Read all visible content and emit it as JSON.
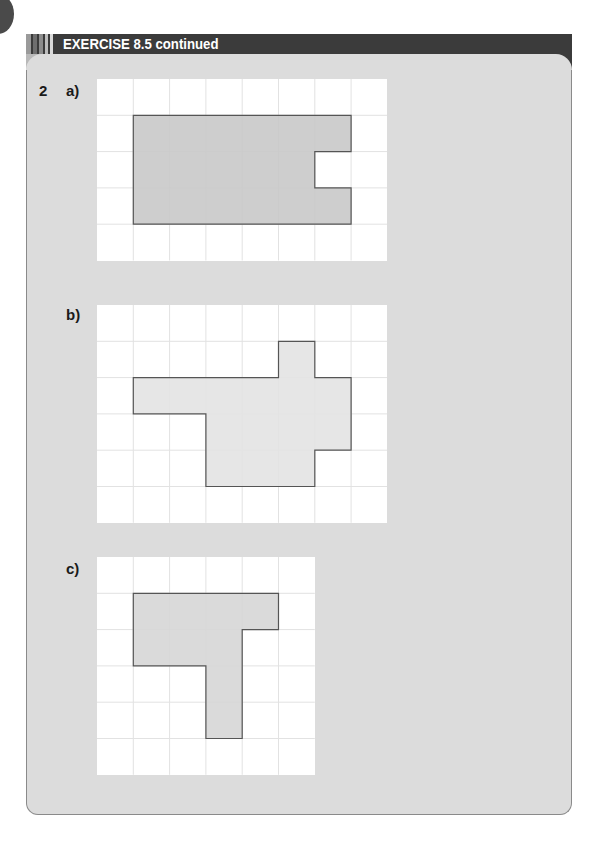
{
  "header": {
    "title": "EXERCISE 8.5 continued"
  },
  "question": {
    "number": "2",
    "parts": [
      {
        "label": "a)",
        "grid": {
          "cols": 8,
          "rows": 5,
          "cell": 36.3
        },
        "shape_fill": "#c9c9c9",
        "shape": [
          [
            1,
            1
          ],
          [
            7,
            1
          ],
          [
            7,
            2
          ],
          [
            6,
            2
          ],
          [
            6,
            3
          ],
          [
            7,
            3
          ],
          [
            7,
            4
          ],
          [
            1,
            4
          ]
        ]
      },
      {
        "label": "b)",
        "grid": {
          "cols": 8,
          "rows": 6,
          "cell": 36.3
        },
        "shape_fill": "#e3e3e3",
        "shape": [
          [
            5,
            1
          ],
          [
            6,
            1
          ],
          [
            6,
            2
          ],
          [
            7,
            2
          ],
          [
            7,
            4
          ],
          [
            6,
            4
          ],
          [
            6,
            5
          ],
          [
            3,
            5
          ],
          [
            3,
            3
          ],
          [
            1,
            3
          ],
          [
            1,
            2
          ],
          [
            5,
            2
          ]
        ]
      },
      {
        "label": "c)",
        "grid": {
          "cols": 6,
          "rows": 6,
          "cell": 36.3
        },
        "shape_fill": "#d6d6d6",
        "shape": [
          [
            1,
            1
          ],
          [
            5,
            1
          ],
          [
            5,
            2
          ],
          [
            4,
            2
          ],
          [
            4,
            5
          ],
          [
            3,
            5
          ],
          [
            3,
            3
          ],
          [
            1,
            3
          ]
        ]
      }
    ]
  },
  "colors": {
    "header_bg": "#3b3b3b",
    "panel_bg": "#dcdcdc",
    "grid_line": "#e2e2e2",
    "shape_stroke": "#555555"
  }
}
